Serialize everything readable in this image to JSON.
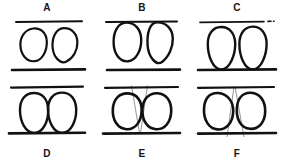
{
  "figure": {
    "width": 284,
    "height": 161,
    "background_color": "#ffffff",
    "ink_color": "#111111",
    "guide_color": "#8a8a8a",
    "panels": [
      {
        "id": "A",
        "label": "A",
        "label_position": "top",
        "state": "eggs free, not touching lines or each other",
        "top_line": {
          "visible": true,
          "style": "solid",
          "thickness": 2.0
        },
        "bottom_line": {
          "visible": true,
          "style": "solid",
          "thickness": 2.4
        },
        "eggs": 2,
        "egg_contact": "none",
        "guides": 0
      },
      {
        "id": "B",
        "label": "B",
        "label_position": "top",
        "state": "eggs pressed against top line, tops flattened",
        "top_line": {
          "visible": true,
          "style": "solid",
          "thickness": 2.0
        },
        "bottom_line": {
          "visible": true,
          "style": "solid",
          "thickness": 2.4
        },
        "eggs": 2,
        "egg_contact": "top-line",
        "guides": 0
      },
      {
        "id": "C",
        "label": "C",
        "label_position": "top",
        "state": "eggs resting on bottom line, top line broken at right",
        "top_line": {
          "visible": true,
          "style": "dashed-break-right",
          "thickness": 1.5
        },
        "bottom_line": {
          "visible": true,
          "style": "solid",
          "thickness": 2.4
        },
        "eggs": 2,
        "egg_contact": "bottom-line",
        "guides": 0
      },
      {
        "id": "D",
        "label": "D",
        "label_position": "bottom",
        "state": "eggs touching each other and resting on bottom line",
        "top_line": {
          "visible": true,
          "style": "solid",
          "thickness": 2.0
        },
        "bottom_line": {
          "visible": true,
          "style": "solid",
          "thickness": 2.4
        },
        "eggs": 2,
        "egg_contact": "each-other-and-bottom-line",
        "guides": 0
      },
      {
        "id": "E",
        "label": "E",
        "label_position": "bottom",
        "state": "tilted eggs with guide lines converging downward to a point on bottom line",
        "top_line": {
          "visible": true,
          "style": "solid",
          "thickness": 2.0
        },
        "bottom_line": {
          "visible": true,
          "style": "solid",
          "thickness": 2.4
        },
        "eggs": 2,
        "egg_contact": "each-other",
        "guides": 2,
        "guide_direction": "converging-down"
      },
      {
        "id": "F",
        "label": "F",
        "label_position": "bottom",
        "state": "tilted eggs with guide lines converging upward to a point on top line",
        "top_line": {
          "visible": true,
          "style": "solid",
          "thickness": 2.0
        },
        "bottom_line": {
          "visible": true,
          "style": "solid",
          "thickness": 2.4
        },
        "eggs": 2,
        "egg_contact": "each-other",
        "guides": 2,
        "guide_direction": "converging-up"
      }
    ]
  }
}
